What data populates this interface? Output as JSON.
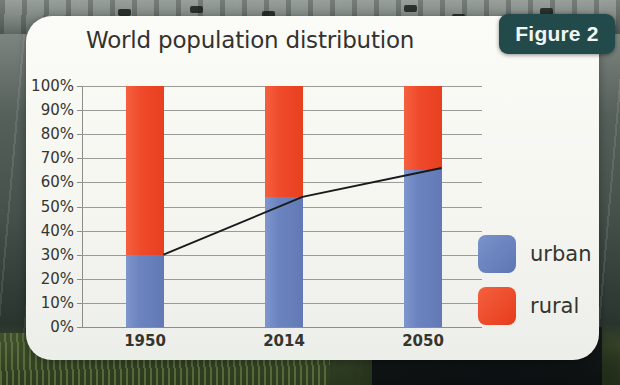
{
  "figure_badge": {
    "label": "Figure 2"
  },
  "chart_data": {
    "type": "bar",
    "subtype": "stacked-bar-with-line",
    "title": "World population distribution",
    "xlabel": "",
    "ylabel": "",
    "categories": [
      "1950",
      "2014",
      "2050"
    ],
    "ylim": [
      0,
      100
    ],
    "ytick_labels": [
      "100%",
      "90%",
      "80%",
      "70%",
      "60%",
      "50%",
      "40%",
      "30%",
      "20%",
      "10%",
      "0%"
    ],
    "yticks": [
      100,
      90,
      80,
      70,
      60,
      50,
      40,
      30,
      20,
      10,
      0
    ],
    "grid": true,
    "legend_position": "right",
    "series": [
      {
        "name": "urban",
        "color": "#6b84c0",
        "values": [
          30,
          54,
          65
        ]
      },
      {
        "name": "rural",
        "color": "#ef4a2b",
        "values": [
          70,
          46,
          35
        ]
      }
    ],
    "overlay_line": {
      "name": "urban trend",
      "color": "#1a1a1a",
      "values": [
        30,
        54,
        66
      ]
    }
  },
  "legend": {
    "items": [
      {
        "label": "urban",
        "color": "#6b84c0"
      },
      {
        "label": "rural",
        "color": "#ef4a2b"
      }
    ]
  },
  "colors": {
    "urban": "#6b84c0",
    "rural": "#ef4a2b",
    "badge": "#234a4b",
    "card": "#f8f8f4",
    "grid": "#9a9a96",
    "text": "#35352f"
  }
}
